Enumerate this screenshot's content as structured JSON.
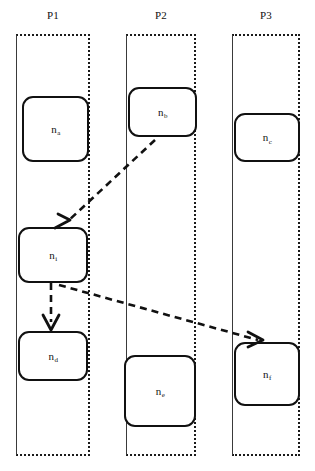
{
  "diagram": {
    "width": 315,
    "height": 471,
    "background": "#ffffff",
    "stroke_color": "#111111",
    "lane_border_style": "dotted"
  },
  "lanes": [
    {
      "id": "P1",
      "label": "P1",
      "x": 16,
      "y": 34,
      "width": 74,
      "height": 422,
      "label_x": 16,
      "label_y": 9,
      "label_width": 74
    },
    {
      "id": "P2",
      "label": "P2",
      "x": 126,
      "y": 34,
      "width": 70,
      "height": 422,
      "label_x": 126,
      "label_y": 9,
      "label_width": 70
    },
    {
      "id": "P3",
      "label": "P3",
      "x": 232,
      "y": 34,
      "width": 68,
      "height": 422,
      "label_x": 232,
      "label_y": 9,
      "label_width": 68
    }
  ],
  "nodes": [
    {
      "id": "na",
      "lane": "P1",
      "base": "n",
      "subscript": "a",
      "x": 22,
      "y": 96,
      "width": 67,
      "height": 66
    },
    {
      "id": "nb",
      "lane": "P2",
      "base": "n",
      "subscript": "b",
      "x": 128,
      "y": 87,
      "width": 69,
      "height": 50
    },
    {
      "id": "nc",
      "lane": "P3",
      "base": "n",
      "subscript": "c",
      "x": 234,
      "y": 113,
      "width": 66,
      "height": 49
    },
    {
      "id": "ni",
      "lane": "P1",
      "base": "n",
      "subscript": "i",
      "x": 18,
      "y": 227,
      "width": 70,
      "height": 56
    },
    {
      "id": "nd",
      "lane": "P1",
      "base": "n",
      "subscript": "d",
      "x": 18,
      "y": 331,
      "width": 70,
      "height": 50
    },
    {
      "id": "ne",
      "lane": "P2",
      "base": "n",
      "subscript": "e",
      "x": 124,
      "y": 355,
      "width": 72,
      "height": 72
    },
    {
      "id": "nf",
      "lane": "P3",
      "base": "n",
      "subscript": "f",
      "x": 234,
      "y": 342,
      "width": 66,
      "height": 64
    }
  ],
  "edges": [
    {
      "id": "nb-to-ni",
      "from": "nb",
      "to": "ni",
      "style": "dashed",
      "kind": "message",
      "path": "M 155 140 L 67 222",
      "head": "M 55 228 L 70 220 M 58 214 L 70 220"
    },
    {
      "id": "ni-to-nd",
      "from": "ni",
      "to": "nd",
      "style": "dashed",
      "kind": "sequence",
      "path": "M 51 283 L 51 322",
      "head": "M 43 315 L 51 330 M 59 315 L 51 330"
    },
    {
      "id": "ni-to-nf",
      "from": "ni",
      "to": "nf",
      "style": "dashed",
      "kind": "message",
      "path": "M 59 285 L 258 340",
      "head": "M 248 332 L 263 340 M 248 347 L 263 340"
    }
  ]
}
